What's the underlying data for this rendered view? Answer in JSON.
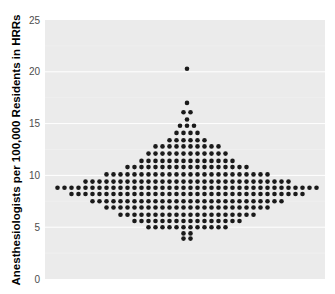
{
  "chart_data": {
    "type": "scatter",
    "subtype": "beeswarm",
    "title": "",
    "xlabel": "",
    "ylabel": "Anesthesiologists per 100,000 Residents in HRRs",
    "ylim": [
      0,
      25
    ],
    "yticks": [
      0,
      5,
      10,
      15,
      20,
      25
    ],
    "grid": true,
    "legend": "none",
    "panel_background": "#ebebeb",
    "gridline_color": "#ffffff",
    "point_color": "#1a1a1a",
    "rows": [
      {
        "value": 20.3,
        "count": 1
      },
      {
        "value": 17.0,
        "count": 1
      },
      {
        "value": 16.1,
        "count": 2
      },
      {
        "value": 15.4,
        "count": 1
      },
      {
        "value": 14.8,
        "count": 3
      },
      {
        "value": 14.1,
        "count": 4
      },
      {
        "value": 13.4,
        "count": 6
      },
      {
        "value": 12.8,
        "count": 10
      },
      {
        "value": 12.1,
        "count": 12
      },
      {
        "value": 11.4,
        "count": 14
      },
      {
        "value": 10.8,
        "count": 18
      },
      {
        "value": 10.1,
        "count": 24
      },
      {
        "value": 9.4,
        "count": 30
      },
      {
        "value": 8.8,
        "count": 38
      },
      {
        "value": 8.2,
        "count": 34
      },
      {
        "value": 7.5,
        "count": 28
      },
      {
        "value": 6.9,
        "count": 24
      },
      {
        "value": 6.2,
        "count": 20
      },
      {
        "value": 5.6,
        "count": 16
      },
      {
        "value": 5.0,
        "count": 12
      },
      {
        "value": 4.4,
        "count": 2
      },
      {
        "value": 3.9,
        "count": 2
      }
    ]
  },
  "axis": {
    "ylabel": "Anesthesiologists per 100,000 Residents in HRRs",
    "tick_labels": [
      "0",
      "5",
      "10",
      "15",
      "20",
      "25"
    ]
  }
}
